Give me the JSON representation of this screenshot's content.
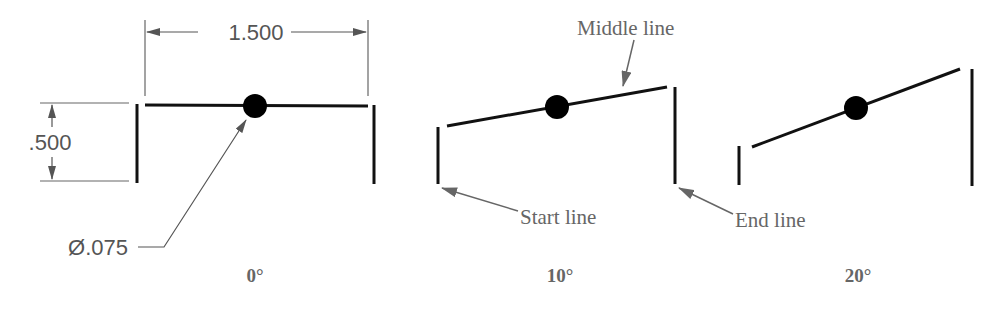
{
  "dimensions": {
    "width_label": "1.500",
    "height_label": ".500",
    "diameter_label": "Ø.075"
  },
  "callouts": {
    "middle_line": "Middle line",
    "start_line": "Start line",
    "end_line": "End line"
  },
  "panels": [
    {
      "angle_label": "0°"
    },
    {
      "angle_label": "10°"
    },
    {
      "angle_label": "20°"
    }
  ],
  "colors": {
    "line": "#111111",
    "dimension": "#555555",
    "label": "#666666"
  }
}
